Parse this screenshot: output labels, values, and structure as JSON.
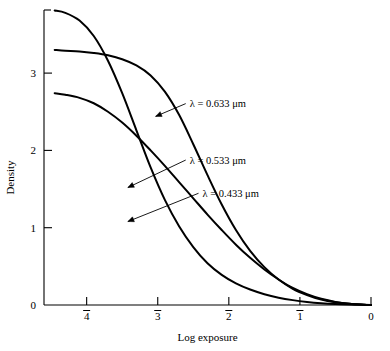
{
  "chart_data": {
    "type": "line",
    "title": "",
    "xlabel": "Log exposure",
    "ylabel": "Density",
    "xlim": [
      -4.6,
      0.0
    ],
    "ylim": [
      0.0,
      3.95
    ],
    "grid": false,
    "legend_position": "inline-annotations",
    "x_tick_values": [
      -4,
      -3,
      -2,
      -1,
      0
    ],
    "x_tick_labels": [
      "4",
      "3",
      "2",
      "1",
      "0"
    ],
    "x_tick_overbar": [
      true,
      true,
      true,
      true,
      false
    ],
    "y_tick_values": [
      0,
      1,
      2,
      3
    ],
    "y_tick_labels": [
      "0",
      "1",
      "2",
      "3"
    ],
    "series": [
      {
        "name": "lambda-0.633",
        "label": "λ = 0.633 μm",
        "wavelength_um": 0.633,
        "x": [
          -4.45,
          -4.3,
          -4.1,
          -3.9,
          -3.7,
          -3.5,
          -3.3,
          -3.1,
          -2.9,
          -2.7,
          -2.5,
          -2.3,
          -2.1,
          -1.9,
          -1.7,
          -1.5,
          -1.3,
          -1.1,
          -0.9,
          -0.7,
          -0.5,
          -0.3,
          -0.1,
          0.0
        ],
        "y": [
          3.3,
          3.29,
          3.28,
          3.26,
          3.23,
          3.18,
          3.1,
          2.97,
          2.76,
          2.46,
          2.08,
          1.68,
          1.3,
          0.97,
          0.7,
          0.49,
          0.33,
          0.21,
          0.13,
          0.07,
          0.035,
          0.015,
          0.004,
          0.0
        ]
      },
      {
        "name": "lambda-0.533",
        "label": "λ = 0.533 μm",
        "wavelength_um": 0.533,
        "x": [
          -4.45,
          -4.3,
          -4.1,
          -3.9,
          -3.7,
          -3.5,
          -3.3,
          -3.1,
          -2.9,
          -2.7,
          -2.5,
          -2.3,
          -2.1,
          -1.9,
          -1.7,
          -1.5,
          -1.3,
          -1.1,
          -0.9,
          -0.7,
          -0.5,
          -0.3,
          -0.1,
          0.0
        ],
        "y": [
          2.74,
          2.72,
          2.68,
          2.61,
          2.5,
          2.36,
          2.19,
          2.0,
          1.8,
          1.59,
          1.38,
          1.17,
          0.97,
          0.78,
          0.61,
          0.46,
          0.33,
          0.22,
          0.14,
          0.08,
          0.04,
          0.016,
          0.004,
          0.0
        ]
      },
      {
        "name": "lambda-0.433",
        "label": "λ = 0.433 μm",
        "wavelength_um": 0.433,
        "x": [
          -4.45,
          -4.3,
          -4.1,
          -3.9,
          -3.7,
          -3.5,
          -3.3,
          -3.1,
          -2.9,
          -2.7,
          -2.5,
          -2.3,
          -2.1,
          -1.9,
          -1.7,
          -1.5,
          -1.3,
          -1.1,
          -0.9,
          -0.7,
          -0.5,
          -0.3,
          -0.1,
          0.0
        ],
        "y": [
          3.81,
          3.78,
          3.68,
          3.48,
          3.16,
          2.74,
          2.26,
          1.78,
          1.36,
          1.02,
          0.75,
          0.54,
          0.39,
          0.28,
          0.2,
          0.14,
          0.095,
          0.063,
          0.04,
          0.024,
          0.013,
          0.006,
          0.002,
          0.0
        ]
      }
    ],
    "annotations": [
      {
        "name": "annotation-0.633",
        "text": "λ = 0.633 μm",
        "label_x": -2.55,
        "label_y": 2.56,
        "arrow_to_x": -3.03,
        "arrow_to_y": 2.44
      },
      {
        "name": "annotation-0.533",
        "text": "λ = 0.533 μm",
        "label_x": -2.55,
        "label_y": 1.83,
        "arrow_to_x": -3.42,
        "arrow_to_y": 1.52
      },
      {
        "name": "annotation-0.433",
        "text": "λ = 0.433 μm",
        "label_x": -2.37,
        "label_y": 1.4,
        "arrow_to_x": -3.42,
        "arrow_to_y": 1.08
      }
    ]
  }
}
